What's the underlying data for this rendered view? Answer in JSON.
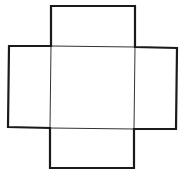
{
  "diagram": {
    "type": "box-net-cross",
    "stroke_color": "#1a1a1a",
    "background": "#ffffff",
    "outer_stroke_width": 2.2,
    "inner_stroke_width": 1,
    "faces": [
      {
        "name": "top-flap",
        "x": 51,
        "y": 6,
        "w": 84,
        "h": 40
      },
      {
        "name": "left-flap",
        "x": 8,
        "y": 46,
        "w": 43,
        "h": 81
      },
      {
        "name": "center-face",
        "x": 51,
        "y": 46,
        "w": 84,
        "h": 82
      },
      {
        "name": "right-flap",
        "x": 135,
        "y": 47,
        "w": 42,
        "h": 82
      },
      {
        "name": "bottom-flap",
        "x": 50,
        "y": 128,
        "w": 84,
        "h": 40
      }
    ]
  }
}
